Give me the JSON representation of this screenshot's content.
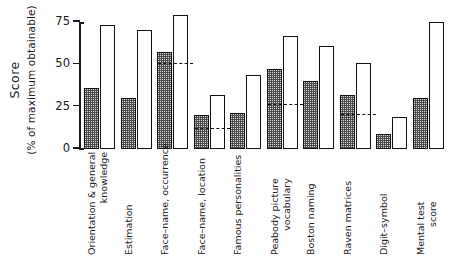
{
  "chart_data": {
    "type": "bar",
    "title": "",
    "xlabel": "",
    "ylabel": "Score",
    "ylabel_sub": "(% of maximum obtainable)",
    "ylim": [
      0,
      75
    ],
    "yticks": [
      0,
      25,
      50,
      75
    ],
    "ytick_labels": [
      "0",
      "25",
      "50",
      "75"
    ],
    "grid": false,
    "legend": "none",
    "categories": [
      "Orientation & general knowledge",
      "Estimation",
      "Face–name, occurrence",
      "Face–name, location",
      "Famous personalities",
      "Peabody picture vocabulary",
      "Boston naming",
      "Raven matrices",
      "Digit–symbol",
      "Mental test score"
    ],
    "category_lines": [
      [
        "Orientation & general",
        "knowledge"
      ],
      [
        "Estimation",
        ""
      ],
      [
        "Face–name, occurrence",
        ""
      ],
      [
        "Face–name, location",
        ""
      ],
      [
        "Famous personalities",
        ""
      ],
      [
        "Peabody picture",
        "vocabulary"
      ],
      [
        "Boston naming",
        ""
      ],
      [
        "Raven matrices",
        ""
      ],
      [
        "Digit–symbol",
        ""
      ],
      [
        "Mental test",
        "score"
      ]
    ],
    "series": [
      {
        "name": "stippled",
        "values": [
          36,
          30,
          57,
          20,
          21,
          47,
          40,
          32,
          9,
          30
        ]
      },
      {
        "name": "open",
        "values": [
          73,
          70,
          79,
          32,
          44,
          67,
          61,
          51,
          19,
          75
        ]
      }
    ],
    "dashed_markers": [
      null,
      null,
      50,
      12,
      null,
      26,
      null,
      20,
      null,
      null
    ]
  }
}
